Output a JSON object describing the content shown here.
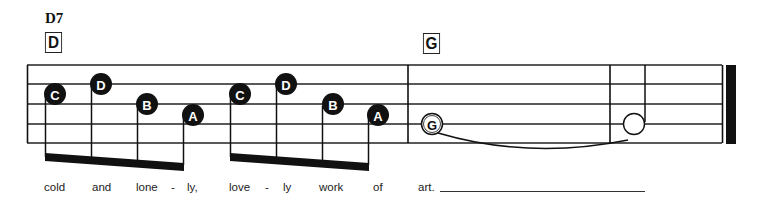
{
  "chords": {
    "chord_name": "D7",
    "boxes": [
      {
        "label": "D",
        "x": 44,
        "y": 32
      },
      {
        "label": "G",
        "x": 422,
        "y": 33
      }
    ]
  },
  "staff": {
    "lines_y": [
      65,
      84,
      104,
      124,
      143
    ],
    "x_start": 27,
    "x_end": 736,
    "barlines_x": [
      27,
      408,
      610
    ],
    "final_bar": {
      "thin_x": 722,
      "thick_x": 726,
      "thick_w": 10
    }
  },
  "notes": [
    {
      "label": "C",
      "x": 55,
      "y": 94,
      "filled": true
    },
    {
      "label": "D",
      "x": 101,
      "y": 84,
      "filled": true
    },
    {
      "label": "B",
      "x": 147,
      "y": 104,
      "filled": true
    },
    {
      "label": "A",
      "x": 193,
      "y": 114,
      "filled": true
    },
    {
      "label": "C",
      "x": 240,
      "y": 94,
      "filled": true
    },
    {
      "label": "D",
      "x": 286,
      "y": 84,
      "filled": true
    },
    {
      "label": "B",
      "x": 333,
      "y": 104,
      "filled": true
    },
    {
      "label": "A",
      "x": 378,
      "y": 114,
      "filled": true
    },
    {
      "label": "G",
      "x": 432,
      "y": 124,
      "filled": false
    },
    {
      "label": "",
      "x": 634,
      "y": 124,
      "filled": false
    }
  ],
  "lyrics": [
    {
      "text": "cold",
      "x": 44
    },
    {
      "text": "and",
      "x": 92
    },
    {
      "text": "lone",
      "x": 136
    },
    {
      "text": "-",
      "x": 170
    },
    {
      "text": "ly,",
      "x": 187
    },
    {
      "text": "love",
      "x": 229
    },
    {
      "text": "-",
      "x": 264
    },
    {
      "text": "ly",
      "x": 282
    },
    {
      "text": "work",
      "x": 319
    },
    {
      "text": "of",
      "x": 373
    },
    {
      "text": "art.",
      "x": 418
    }
  ]
}
